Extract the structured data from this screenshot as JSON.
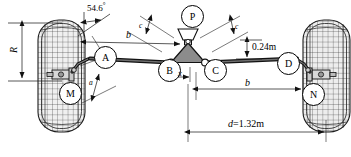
{
  "diagram": {
    "type": "engineering-schematic",
    "nodes": [
      {
        "id": "A",
        "label": "A",
        "x": 105,
        "y": 57,
        "r": 11
      },
      {
        "id": "B",
        "label": "B",
        "x": 169,
        "y": 70,
        "r": 11
      },
      {
        "id": "C",
        "label": "C",
        "x": 215,
        "y": 70,
        "r": 11
      },
      {
        "id": "D",
        "label": "D",
        "x": 288,
        "y": 63,
        "r": 11
      },
      {
        "id": "M",
        "label": "M",
        "x": 70,
        "y": 93,
        "r": 11
      },
      {
        "id": "N",
        "label": "N",
        "x": 313,
        "y": 94,
        "r": 11
      },
      {
        "id": "P",
        "label": "P",
        "x": 192,
        "y": 16,
        "r": 11
      }
    ],
    "dimensions": [
      {
        "id": "angle-54-6",
        "label": "54.6",
        "unit": "°",
        "text": "54.6°"
      },
      {
        "id": "radius-R",
        "label": "R",
        "text": "R"
      },
      {
        "id": "length-b-top",
        "label": "b",
        "text": "b"
      },
      {
        "id": "length-b-bottom",
        "label": "b",
        "text": "b"
      },
      {
        "id": "offset-c-left",
        "label": "c",
        "text": "c"
      },
      {
        "id": "offset-c-right",
        "label": "c",
        "text": "c"
      },
      {
        "id": "offset-x",
        "label": "x",
        "text": "x"
      },
      {
        "id": "angle-a",
        "label": "a",
        "text": "a"
      },
      {
        "id": "height-024",
        "label": "0.24m",
        "text": "0.24m"
      },
      {
        "id": "track-d",
        "label": "d=1.32m",
        "text": "d=1.32m"
      }
    ],
    "labels": {
      "angle_54_6_num": "54.6",
      "angle_54_6_deg": "°",
      "radius_R": "R",
      "length_b_top": "b",
      "length_b_bottom": "b",
      "offset_c_left": "c",
      "offset_c_right": "c",
      "offset_x": "x",
      "angle_a": "a",
      "height_024m": "0.24m",
      "track_d_sym": "d",
      "track_d_val": "=1.32m",
      "node_A": "A",
      "node_B": "B",
      "node_C": "C",
      "node_D": "D",
      "node_M": "M",
      "node_N": "N",
      "node_P": "P"
    },
    "colors": {
      "stroke": "#000000",
      "background": "#ffffff",
      "pitman_fill": "#8c8c8c",
      "tire_fill": "#f2f2f2",
      "dim_line": "#3a3a3a"
    }
  }
}
